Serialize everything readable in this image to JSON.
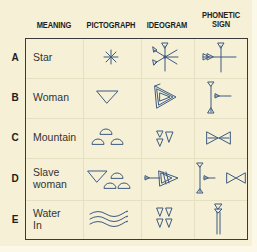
{
  "headers": {
    "meaning": "MEANING",
    "pictograph": "PICTOGRAPH",
    "ideogram": "IDEOGRAM",
    "phonetic_line1": "PHONETIC",
    "phonetic_line2": "SIGN"
  },
  "rows": [
    {
      "letter": "A",
      "meaning": "Star",
      "pictograph": "asterisk-star-icon",
      "ideogram": "star-ideogram-icon",
      "phonetic": "star-phonetic-sign-icon"
    },
    {
      "letter": "B",
      "meaning": "Woman",
      "pictograph": "triangle-pubic-icon",
      "ideogram": "woman-ideogram-icon",
      "phonetic": "woman-phonetic-sign-icon"
    },
    {
      "letter": "C",
      "meaning": "Mountain",
      "pictograph": "three-hills-icon",
      "ideogram": "mountain-ideogram-icon",
      "phonetic": "mountain-phonetic-sign-icon"
    },
    {
      "letter": "D",
      "meaning_line1": "Slave",
      "meaning_line2": "woman",
      "pictograph": "woman-plus-mountain-icon",
      "ideogram": "slave-woman-ideogram-icon",
      "phonetic": "slave-woman-phonetic-sign-icon"
    },
    {
      "letter": "E",
      "meaning_line1": "Water",
      "meaning_line2": "In",
      "pictograph": "wavy-water-icon",
      "ideogram": "water-ideogram-icon",
      "phonetic": "water-phonetic-sign-icon"
    }
  ],
  "colors": {
    "background": "#f5f0d6",
    "glyph_stroke": "#3d5a80",
    "border": "#3a3a3a",
    "text": "#1e1e1e"
  }
}
